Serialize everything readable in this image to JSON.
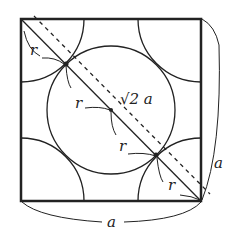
{
  "diagram": {
    "labels": {
      "r1": "r",
      "r2": "r",
      "r3": "r",
      "r4": "r",
      "diagonal": "√2 a",
      "side_right": "a",
      "side_bottom": "a"
    },
    "colors": {
      "stroke": "#222222",
      "background": "#ffffff"
    }
  }
}
